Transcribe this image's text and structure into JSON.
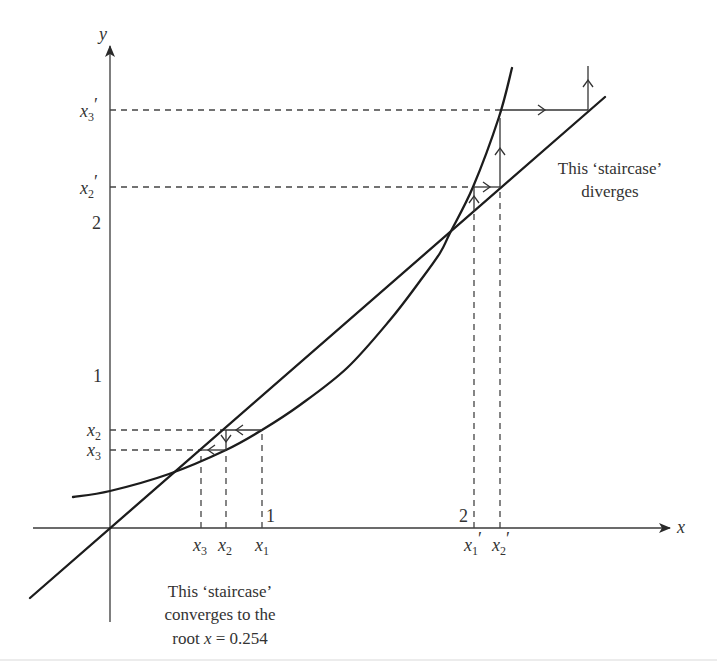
{
  "axes": {
    "x_label": "x",
    "y_label": "y"
  },
  "y_axis_labels": {
    "x3_prime": {
      "var": "x",
      "sub": "3",
      "prime": "′"
    },
    "x2_prime": {
      "var": "x",
      "sub": "2",
      "prime": "′"
    },
    "two": "2",
    "one": "1",
    "x2": {
      "var": "x",
      "sub": "2"
    },
    "x3": {
      "var": "x",
      "sub": "3"
    }
  },
  "x_axis_labels": {
    "one": "1",
    "two": "2",
    "x3": {
      "var": "x",
      "sub": "3"
    },
    "x2": {
      "var": "x",
      "sub": "2"
    },
    "x1": {
      "var": "x",
      "sub": "1"
    },
    "x1_prime": {
      "var": "x",
      "sub": "1",
      "prime": "′"
    },
    "x2_prime": {
      "var": "x",
      "sub": "2",
      "prime": "′"
    }
  },
  "annotations": {
    "diverges": {
      "line1": "This ‘staircase’",
      "line2": "diverges"
    },
    "converges": {
      "line1": "This ‘staircase’",
      "line2": "converges to the",
      "line3_prefix": "root ",
      "line3_var": "x",
      "line3_suffix": " = 0.254"
    }
  },
  "colors": {
    "ink": "#1c1c1c",
    "text": "#333333",
    "background": "#ffffff"
  }
}
